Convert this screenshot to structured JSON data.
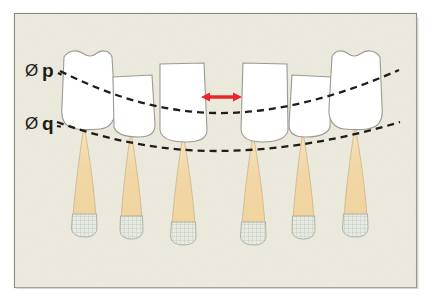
{
  "figure": {
    "name": "dental-occlusal-plane-diagram",
    "frame": {
      "border_color": "#8a8a84",
      "background_color": "#edeade",
      "paper_color": "#ffffff",
      "x": 14,
      "y": 13,
      "width": 403,
      "height": 275
    },
    "labels": [
      {
        "id": "plane-p",
        "symbol": "Ø",
        "text": "p",
        "full_text": "Ø p",
        "x": 24,
        "y": 75,
        "description": "upper reference plane label"
      },
      {
        "id": "plane-q",
        "symbol": "Ø",
        "text": "q",
        "full_text": "Ø q",
        "x": 24,
        "y": 128,
        "description": "lower reference plane label"
      }
    ],
    "curves": [
      {
        "id": "curve-p",
        "label": "p",
        "color": "#201c18",
        "style": "dashed",
        "path": "M 60 71 C 110 96 160 112 216 113 C 275 114 340 96 399 70"
      },
      {
        "id": "curve-q",
        "label": "q",
        "color": "#201c18",
        "style": "dashed",
        "path": "M 57 122 C 110 141 163 151 216 151 C 277 151 341 140 400 122"
      }
    ],
    "arrow": {
      "id": "interdental-gap-arrow",
      "color": "#e8252a",
      "x1": 202,
      "x2": 241,
      "y": 97,
      "double_headed": true,
      "description": "red double-headed arrow marking interdental space"
    },
    "colors": {
      "crown_fill": "#ffffff",
      "crown_stroke": "#9b9b93",
      "root_fill": "#f2d9ad",
      "root_fill_light": "#f7e6c6",
      "root_stroke": "#cbb388",
      "tip_fill": "#e3e8df",
      "tip_stroke": "#a8ab9f",
      "hatch_color": "#b9c2b6",
      "accent_red": "#e8252a",
      "background": "#edeade",
      "border": "#8a8a84"
    },
    "teeth": [
      {
        "id": "tooth-1",
        "position": 1,
        "type": "incisor",
        "crown_style": "tall-wavy",
        "crown": {
          "x": 62,
          "y": 50,
          "width": 50,
          "height": 78
        },
        "root": {
          "apex_x": 84,
          "apex_y": 128,
          "tip_y": 232
        },
        "root_width": 26
      },
      {
        "id": "tooth-2",
        "position": 2,
        "type": "lateral",
        "crown_style": "short-trapezoid",
        "crown": {
          "x": 110,
          "y": 73,
          "width": 44,
          "height": 62
        },
        "root": {
          "apex_x": 131,
          "apex_y": 133,
          "tip_y": 236
        },
        "root_width": 24
      },
      {
        "id": "tooth-3",
        "position": 3,
        "type": "central",
        "crown_style": "tall-trapezoid",
        "crown": {
          "x": 156,
          "y": 61,
          "width": 50,
          "height": 77
        },
        "root": {
          "apex_x": 183,
          "apex_y": 136,
          "tip_y": 240
        },
        "root_width": 26
      },
      {
        "id": "tooth-4",
        "position": 4,
        "type": "central",
        "crown_style": "tall-trapezoid",
        "crown": {
          "x": 238,
          "y": 61,
          "width": 50,
          "height": 77
        },
        "root": {
          "apex_x": 253,
          "apex_y": 136,
          "tip_y": 240
        },
        "root_width": 26
      },
      {
        "id": "tooth-5",
        "position": 5,
        "type": "lateral",
        "crown_style": "short-trapezoid",
        "crown": {
          "x": 288,
          "y": 73,
          "width": 44,
          "height": 62
        },
        "root": {
          "apex_x": 303,
          "apex_y": 133,
          "tip_y": 236
        },
        "root_width": 24
      },
      {
        "id": "tooth-6",
        "position": 6,
        "type": "incisor",
        "crown_style": "tall-wavy",
        "crown": {
          "x": 330,
          "y": 50,
          "width": 50,
          "height": 78
        },
        "root": {
          "apex_x": 355,
          "apex_y": 128,
          "tip_y": 232
        },
        "root_width": 26
      }
    ]
  }
}
